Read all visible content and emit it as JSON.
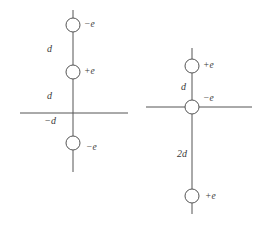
{
  "figure": {
    "background_color": "#ffffff",
    "line_color": "#555555",
    "text_color": "#3b3b3b"
  },
  "diagrams": [
    {
      "id": "left-configuration",
      "name": "left-charge-configuration",
      "axis_x": 73,
      "axis_top": 10,
      "axis_bottom": 172,
      "horizontal_axis": {
        "y": 113,
        "x_start": 20,
        "x_end": 128
      },
      "charges": [
        {
          "name": "top-charge",
          "label": "−e",
          "sign": "negative",
          "cx": 73,
          "cy": 25,
          "r": 7,
          "label_x": 84,
          "label_y": 25
        },
        {
          "name": "middle-charge",
          "label": "+e",
          "sign": "positive",
          "cx": 73,
          "cy": 72,
          "r": 7,
          "label_x": 84,
          "label_y": 72
        },
        {
          "name": "bottom-charge",
          "label": "−e",
          "sign": "negative",
          "cx": 73,
          "cy": 143,
          "r": 7,
          "label_x": 86,
          "label_y": 148
        }
      ],
      "distances": [
        {
          "name": "distance-top-gap",
          "label": "d",
          "x": 52,
          "y": 50
        },
        {
          "name": "distance-middle-gap",
          "label": "d",
          "x": 52,
          "y": 97
        },
        {
          "name": "distance-below-axis",
          "label": "−d",
          "x": 56,
          "y": 122
        }
      ]
    },
    {
      "id": "right-configuration",
      "name": "right-charge-configuration",
      "axis_x": 192,
      "axis_top": 48,
      "axis_bottom": 214,
      "horizontal_axis": {
        "y": 107,
        "x_start": 146,
        "x_end": 252
      },
      "charges": [
        {
          "name": "top-charge",
          "label": "+e",
          "sign": "positive",
          "cx": 192,
          "cy": 66,
          "r": 7,
          "label_x": 203,
          "label_y": 66
        },
        {
          "name": "center-charge",
          "label": "−e",
          "sign": "negative",
          "cx": 192,
          "cy": 107,
          "r": 7,
          "label_x": 203,
          "label_y": 99
        },
        {
          "name": "bottom-charge",
          "label": "+e",
          "sign": "positive",
          "cx": 192,
          "cy": 196,
          "r": 7,
          "label_x": 205,
          "label_y": 197
        }
      ],
      "distances": [
        {
          "name": "distance-top-gap",
          "label": "d",
          "x": 186,
          "y": 88
        },
        {
          "name": "distance-bottom-gap",
          "label": "2d",
          "x": 187,
          "y": 155
        }
      ]
    }
  ]
}
